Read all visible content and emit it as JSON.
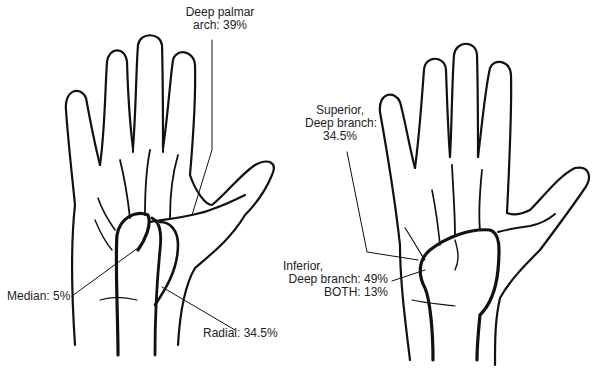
{
  "figure": {
    "panels": [
      {
        "id": "left-hand",
        "labels": {
          "deep_palmar_line1": "Deep palmar",
          "deep_palmar_line2": "arch: 39%",
          "median": "Median: 5%",
          "radial": "Radial: 34.5%"
        }
      },
      {
        "id": "right-hand",
        "labels": {
          "superior_line1": "Superior,",
          "superior_line2": "Deep branch:",
          "superior_line3": "34.5%",
          "inferior_line1": "Inferior,",
          "inferior_line2": "Deep branch: 49%",
          "both": "BOTH: 13%"
        }
      }
    ],
    "colors": {
      "ink": "#111111",
      "background": "#ffffff"
    }
  }
}
